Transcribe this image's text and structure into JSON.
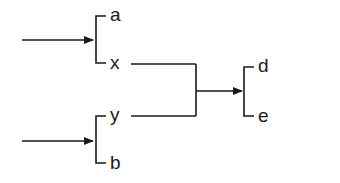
{
  "diagram": {
    "type": "reaction-scheme",
    "colors": {
      "line": "#1a1a1a",
      "background": "#ffffff"
    },
    "groups": [
      {
        "id": "input-group-1",
        "items": [
          {
            "label": "a"
          },
          {
            "label": "x"
          }
        ],
        "incoming_arrow": true
      },
      {
        "id": "input-group-2",
        "items": [
          {
            "label": "y"
          },
          {
            "label": "b"
          }
        ],
        "incoming_arrow": true
      },
      {
        "id": "output-group",
        "items": [
          {
            "label": "d"
          },
          {
            "label": "e"
          }
        ],
        "incoming_arrow": true
      }
    ],
    "connections": [
      {
        "from": "x",
        "to": "junction"
      },
      {
        "from": "y",
        "to": "junction"
      },
      {
        "from": "junction",
        "to": "output-group"
      }
    ]
  }
}
